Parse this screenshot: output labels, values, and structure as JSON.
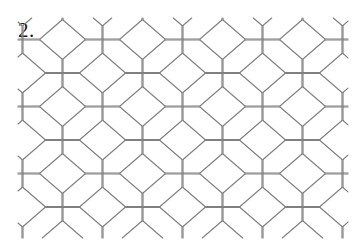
{
  "figure": {
    "item_number_label": "2.",
    "caption": "",
    "background_color": "#ffffff",
    "line_color": "#808080",
    "label_color": "#1a1a1a",
    "line_width_px": 1.15,
    "width_px": 362,
    "height_px": 250
  },
  "tiling": {
    "type": "hexagonal-tessellation",
    "description": "Elongated flat-top hexagon tiling (honeycomb) with edge stubs running off all four sides",
    "cell": {
      "flat_top_width_px": 35,
      "vertical_side_height_px": 28,
      "slant_run_px": 22,
      "slant_rise_px": 19,
      "total_cell_width_px": 79,
      "total_cell_height_px": 66
    },
    "grid": {
      "column_period_px": 80,
      "row_period_px": 67,
      "row_offset_px": 40,
      "origin_x_px": 85,
      "origin_y_px": 40,
      "columns": 4,
      "rows": 3,
      "offset_columns": 4,
      "offset_rows": 3
    },
    "clip": {
      "left_px": 18,
      "right_px": 348,
      "top_px": 18,
      "bottom_px": 238
    },
    "stubs": {
      "top_vertical_len_px": 18,
      "bottom_vertical_len_px": 18,
      "left_horizontal_len_px": 14,
      "right_horizontal_len_px": 14
    }
  }
}
